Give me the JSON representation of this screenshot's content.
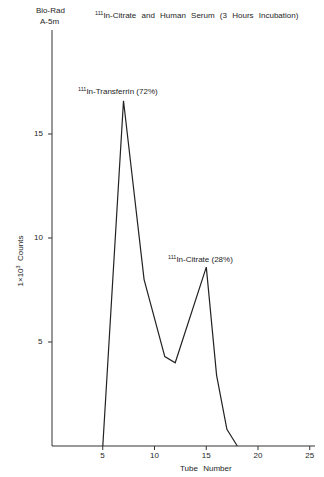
{
  "header": {
    "column_line1": "Bio-Rad",
    "column_line2": "A-5m",
    "title_sup": "111",
    "title_text": "In-Citrate and Human Serum (3 Hours Incubation)"
  },
  "annotations": {
    "peak1_sup": "111",
    "peak1_text": "In-Transferrin (72%)",
    "peak2_sup": "111",
    "peak2_text": "In-Citrate (28%)"
  },
  "axes": {
    "ylabel_prefix": "1×10",
    "ylabel_exp": "3",
    "ylabel_suffix": "Counts",
    "xlabel": "Tube Number"
  },
  "chart_data": {
    "type": "line",
    "title": "111In-Citrate and Human Serum (3 Hours Incubation)",
    "subtitle": "Bio-Rad A-5m",
    "xlabel": "Tube Number",
    "ylabel": "1x10^3 Counts",
    "x_ticks": [
      5,
      10,
      15,
      20,
      25
    ],
    "y_ticks": [
      5,
      10,
      15
    ],
    "xlim": [
      0,
      25.5
    ],
    "ylim": [
      0,
      16.9
    ],
    "grid": false,
    "legend": null,
    "series": [
      {
        "name": "111In activity",
        "x": [
          5,
          7,
          9,
          11,
          12,
          15,
          16,
          17,
          18
        ],
        "y": [
          0,
          16.6,
          8.0,
          4.3,
          4.0,
          8.6,
          3.4,
          0.8,
          0
        ]
      }
    ],
    "annotations": [
      {
        "text": "111In-Transferrin (72%)",
        "x": 7,
        "y": 16.6
      },
      {
        "text": "111In-Citrate (28%)",
        "x": 15,
        "y": 8.6
      }
    ]
  }
}
